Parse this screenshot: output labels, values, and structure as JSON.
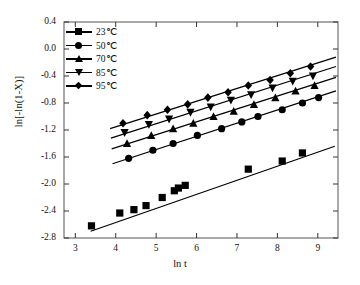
{
  "axes": {
    "xlabel": "ln t",
    "ylabel": "ln[-ln(1-X)]",
    "xticks": [
      "3",
      "4",
      "5",
      "6",
      "7",
      "8",
      "9"
    ],
    "yticks": [
      "0.4",
      "0.0",
      "-0.4",
      "-0.8",
      "-1.2",
      "-1.6",
      "-2.0",
      "-2.4",
      "-2.8"
    ]
  },
  "legend": [
    {
      "label": "23℃",
      "marker": "square-marker"
    },
    {
      "label": "50℃",
      "marker": "circle-marker"
    },
    {
      "label": "70℃",
      "marker": "triangle-up-marker"
    },
    {
      "label": "85℃",
      "marker": "triangle-down-marker"
    },
    {
      "label": "95℃",
      "marker": "diamond-marker"
    }
  ],
  "chart_data": {
    "type": "scatter",
    "title": "",
    "xlabel": "ln t",
    "ylabel": "ln[-ln(1-X)]",
    "xlim": [
      2.72,
      9.5
    ],
    "ylim": [
      -2.8,
      0.4
    ],
    "xticks": [
      3,
      4,
      5,
      6,
      7,
      8,
      9
    ],
    "yticks": [
      0.4,
      0.0,
      -0.4,
      -0.8,
      -1.2,
      -1.6,
      -2.0,
      -2.4,
      -2.8
    ],
    "grid": false,
    "legend_position": "top-left-inside",
    "series": [
      {
        "name": "23℃",
        "marker": "square",
        "color": "#000000",
        "points": [
          [
            3.4,
            -2.62
          ],
          [
            4.1,
            -2.43
          ],
          [
            4.45,
            -2.38
          ],
          [
            4.75,
            -2.32
          ],
          [
            5.15,
            -2.2
          ],
          [
            5.45,
            -2.1
          ],
          [
            5.55,
            -2.06
          ],
          [
            5.72,
            -2.02
          ],
          [
            7.28,
            -1.78
          ],
          [
            8.12,
            -1.66
          ],
          [
            8.62,
            -1.54
          ]
        ],
        "fit_line": {
          "x": [
            3.38,
            9.42
          ],
          "y": [
            -2.7,
            -1.44
          ],
          "slope": 0.208,
          "intercept": -3.4
        }
      },
      {
        "name": "50℃",
        "marker": "circle",
        "color": "#000000",
        "points": [
          [
            4.32,
            -1.62
          ],
          [
            4.92,
            -1.5
          ],
          [
            5.42,
            -1.4
          ],
          [
            6.02,
            -1.28
          ],
          [
            6.62,
            -1.18
          ],
          [
            7.12,
            -1.08
          ],
          [
            7.52,
            -1.0
          ],
          [
            8.12,
            -0.9
          ],
          [
            8.62,
            -0.8
          ],
          [
            9.02,
            -0.72
          ]
        ],
        "fit_line": {
          "x": [
            3.92,
            9.45
          ],
          "y": [
            -1.7,
            -0.62
          ],
          "slope": 0.195,
          "intercept": -2.46
        }
      },
      {
        "name": "70℃",
        "marker": "triangle-up",
        "color": "#000000",
        "points": [
          [
            4.28,
            -1.4
          ],
          [
            4.88,
            -1.28
          ],
          [
            5.42,
            -1.18
          ],
          [
            5.92,
            -1.1
          ],
          [
            6.42,
            -1.0
          ],
          [
            6.92,
            -0.92
          ],
          [
            7.42,
            -0.82
          ],
          [
            7.95,
            -0.72
          ],
          [
            8.45,
            -0.62
          ],
          [
            8.92,
            -0.54
          ]
        ],
        "fit_line": {
          "x": [
            3.9,
            9.45
          ],
          "y": [
            -1.48,
            -0.42
          ],
          "slope": 0.191,
          "intercept": -2.22
        }
      },
      {
        "name": "85℃",
        "marker": "triangle-down",
        "color": "#000000",
        "points": [
          [
            4.22,
            -1.24
          ],
          [
            4.82,
            -1.12
          ],
          [
            5.32,
            -1.04
          ],
          [
            5.85,
            -0.94
          ],
          [
            6.35,
            -0.86
          ],
          [
            6.85,
            -0.76
          ],
          [
            7.35,
            -0.68
          ],
          [
            7.88,
            -0.58
          ],
          [
            8.38,
            -0.48
          ],
          [
            8.88,
            -0.4
          ]
        ],
        "fit_line": {
          "x": [
            3.88,
            9.45
          ],
          "y": [
            -1.32,
            -0.26
          ],
          "slope": 0.19,
          "intercept": -2.06
        }
      },
      {
        "name": "95℃",
        "marker": "diamond",
        "color": "#000000",
        "points": [
          [
            4.18,
            -1.1
          ],
          [
            4.78,
            -0.98
          ],
          [
            5.28,
            -0.9
          ],
          [
            5.78,
            -0.82
          ],
          [
            6.28,
            -0.72
          ],
          [
            6.78,
            -0.64
          ],
          [
            7.28,
            -0.54
          ],
          [
            7.82,
            -0.46
          ],
          [
            8.32,
            -0.36
          ],
          [
            8.82,
            -0.26
          ]
        ],
        "fit_line": {
          "x": [
            3.86,
            9.45
          ],
          "y": [
            -1.18,
            -0.12
          ],
          "slope": 0.19,
          "intercept": -1.92
        }
      }
    ]
  }
}
